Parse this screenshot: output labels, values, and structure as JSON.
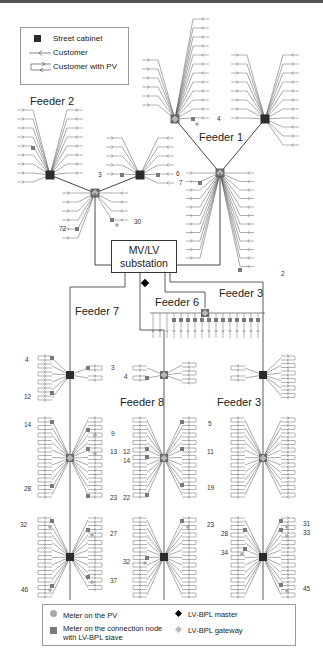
{
  "legend_top": {
    "items": [
      {
        "icon": "street-cabinet-icon",
        "label": "Street cabinet"
      },
      {
        "icon": "customer-icon",
        "label": "Customer"
      },
      {
        "icon": "customer-pv-icon",
        "label": "Customer with PV"
      }
    ]
  },
  "legend_bottom": {
    "items": [
      {
        "icon": "meter-pv-icon",
        "label": "Meter on the PV"
      },
      {
        "icon": "meter-connection-node-icon",
        "label_line1": "Meter on the connection node",
        "label_line2": "with LV-BPL slave"
      },
      {
        "icon": "bpl-master-icon",
        "label": "LV-BPL master"
      },
      {
        "icon": "bpl-gateway-icon",
        "label": "LV-BPL gateway"
      }
    ]
  },
  "substation": {
    "line1": "MV/LV",
    "line2": "substation"
  },
  "feeders": {
    "f1": "Feeder 1",
    "f2": "Feeder 2",
    "f3a": "Feeder 3",
    "f3b": "Feeder 3",
    "f6": "Feeder 6",
    "f7": "Feeder 7",
    "f8": "Feeder 8"
  },
  "node_numbers": {
    "f1_4": "4",
    "f1_6": "6",
    "f1_7": "7",
    "f1_2": "2",
    "f2_3": "3",
    "f2_72": "72",
    "f2_30": "30",
    "f7_4": "4",
    "f7_12": "12",
    "f7_3": "3",
    "f7_14": "14",
    "f7_28": "28",
    "f7_9": "9",
    "f7_13": "13",
    "f7_23": "23",
    "f7_32": "32",
    "f7_46": "46",
    "f7_27": "27",
    "f7_37": "37",
    "f8_4": "4",
    "f8_12": "12",
    "f8_14": "14",
    "f8_22": "22",
    "f8_5": "5",
    "f8_11": "11",
    "f8_19": "19",
    "f8_32": "32",
    "f8_23": "23",
    "f3_28": "28",
    "f3_34": "34",
    "f3_31": "31",
    "f3_33": "33",
    "f3_45": "45"
  },
  "colors": {
    "line": "#333333",
    "cabinet": "#2b2b2b",
    "gateway": "#b8b8b8",
    "meter": "#7a7a7a",
    "master": "#000000"
  }
}
